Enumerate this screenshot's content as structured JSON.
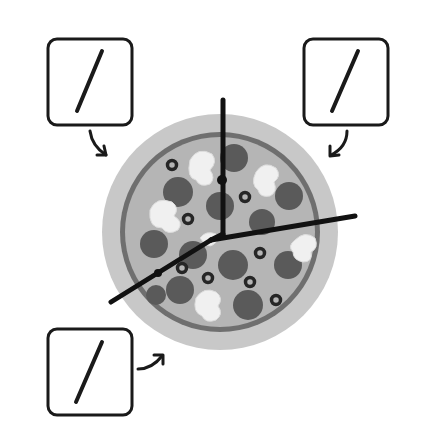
{
  "figure": {
    "boxes": [
      {
        "id": "top-left",
        "symbol": "/"
      },
      {
        "id": "top-right",
        "symbol": "/"
      },
      {
        "id": "bottom-left",
        "symbol": "/"
      }
    ],
    "cut_lines": 3,
    "colors": {
      "crust_outer": "#c4c4c4",
      "crust_ring": "#6e6e6e",
      "sauce": "#b3b3b3",
      "pepperoni": "#5a5a5a",
      "mushroom": "#f2f2f2",
      "olive": "#2a2a2a",
      "cut_line": "#111111",
      "box_border": "#1a1a1a"
    }
  }
}
